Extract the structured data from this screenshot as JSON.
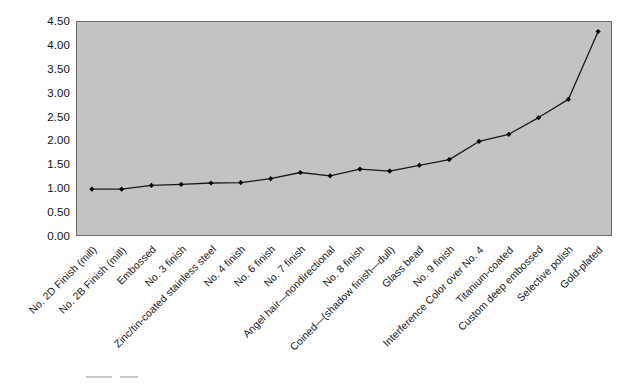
{
  "chart_data": {
    "type": "line",
    "title": "",
    "subtitle": "",
    "xlabel": "",
    "ylabel": "",
    "ylim": [
      0.0,
      4.5
    ],
    "ytick_step": 0.5,
    "ytick_labels": [
      "4.50",
      "4.00",
      "3.50",
      "3.00",
      "2.50",
      "2.00",
      "1.50",
      "1.00",
      "0.50",
      "0.00"
    ],
    "ytick_values": [
      4.5,
      4.0,
      3.5,
      3.0,
      2.5,
      2.0,
      1.5,
      1.0,
      0.5,
      0.0
    ],
    "grid": false,
    "legend": false,
    "legend_position": "none",
    "plot_background_color": "#c3c3c3",
    "line_color": "#1a1a1a",
    "marker_color": "#000000",
    "marker_shape": "diamond",
    "categories": [
      "No. 2D Finish (mill)",
      "No. 2B Finish (mill)",
      "Embossed",
      "No. 3 finish",
      "Zinc/tin-coated stainless steel",
      "No. 4 finish",
      "No. 6 finish",
      "No. 7 finish",
      "Angel hair—nondirectional",
      "No. 8 finish",
      "Coined—(shadow finish—dull)",
      "Glass bead",
      "No. 9 finish",
      "Interference Color over No. 4",
      "Titanium-coated",
      "Custom deep embossed",
      "Selective polish",
      "Gold-plated"
    ],
    "values": [
      1.0,
      1.0,
      1.08,
      1.1,
      1.13,
      1.14,
      1.22,
      1.35,
      1.28,
      1.42,
      1.38,
      1.5,
      1.62,
      2.0,
      2.15,
      2.5,
      2.88,
      4.3
    ]
  }
}
